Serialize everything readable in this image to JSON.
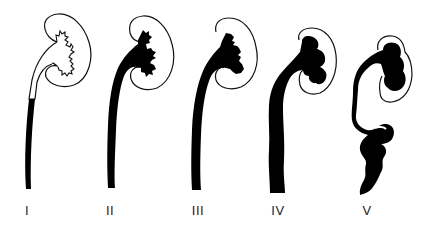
{
  "figure": {
    "grades": [
      {
        "label": "I",
        "x": 27
      },
      {
        "label": "II",
        "x": 110
      },
      {
        "label": "III",
        "x": 198
      },
      {
        "label": "IV",
        "x": 278
      },
      {
        "label": "V",
        "x": 367
      }
    ],
    "colors": {
      "background": "#ffffff",
      "fill": "#000000",
      "outline": "#111111"
    }
  }
}
